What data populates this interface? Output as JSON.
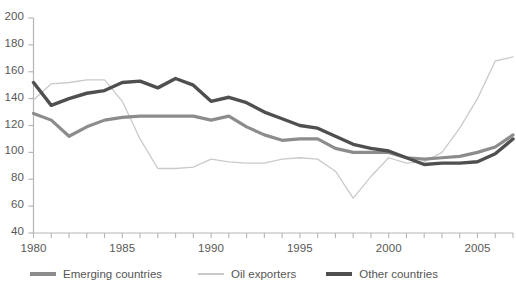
{
  "chart_data": {
    "type": "line",
    "title": "",
    "subtitle": "",
    "xlabel": "",
    "ylabel": "",
    "xlim": [
      1980,
      2007
    ],
    "ylim": [
      40,
      200
    ],
    "ytick_step": 20,
    "grid": false,
    "legend_position": "bottom-left",
    "x": [
      1980,
      1981,
      1982,
      1983,
      1984,
      1985,
      1986,
      1987,
      1988,
      1989,
      1990,
      1991,
      1992,
      1993,
      1994,
      1995,
      1996,
      1997,
      1998,
      1999,
      2000,
      2001,
      2002,
      2003,
      2004,
      2005,
      2006,
      2007
    ],
    "xticks": [
      1980,
      1985,
      1990,
      1995,
      2000,
      2005
    ],
    "xtick_labels": [
      "1980",
      "1985",
      "1990",
      "1995",
      "2000",
      "2005"
    ],
    "yticks": [
      40,
      60,
      80,
      100,
      120,
      140,
      160,
      180,
      200
    ],
    "ytick_labels": [
      "40",
      "60",
      "80",
      "100",
      "120",
      "140",
      "160",
      "180",
      "200"
    ],
    "series": [
      {
        "name": "Emerging countries",
        "color": "#8c8c8c",
        "width": 3.2,
        "values": [
          129,
          124,
          112,
          119,
          124,
          126,
          127,
          127,
          127,
          127,
          124,
          127,
          119,
          113,
          109,
          110,
          110,
          103,
          100,
          100,
          100,
          96,
          95,
          96,
          97,
          100,
          104,
          113
        ]
      },
      {
        "name": "Oil exporters",
        "color": "#cacaca",
        "width": 1.3,
        "values": [
          139,
          151,
          152,
          154,
          154,
          138,
          110,
          88,
          88,
          89,
          95,
          93,
          92,
          92,
          95,
          96,
          95,
          86,
          66,
          82,
          96,
          92,
          93,
          100,
          118,
          140,
          168,
          171
        ]
      },
      {
        "name": "Other countries",
        "color": "#4f4f4f",
        "width": 3.4,
        "values": [
          152,
          135,
          140,
          144,
          146,
          152,
          153,
          148,
          155,
          150,
          138,
          141,
          137,
          130,
          125,
          120,
          118,
          112,
          106,
          103,
          101,
          96,
          91,
          92,
          92,
          93,
          99,
          110
        ]
      }
    ]
  },
  "legend": {
    "items": [
      {
        "label": "Emerging countries"
      },
      {
        "label": "Oil exporters"
      },
      {
        "label": "Other countries"
      }
    ]
  },
  "axis": {
    "line_color": "#b5b5b5"
  }
}
